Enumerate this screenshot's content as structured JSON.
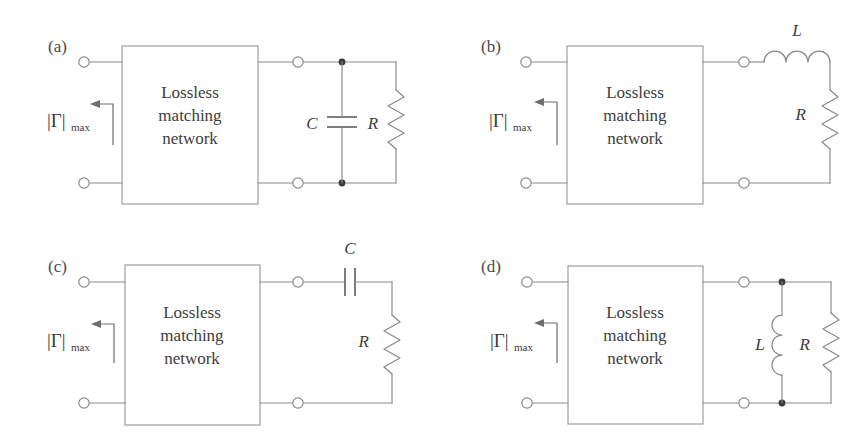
{
  "figure": {
    "background_color": "#ffffff",
    "wire_color": "#8a8a8a",
    "text_color": "#3d3d3d",
    "width": 866,
    "height": 440
  },
  "common": {
    "box_line_1": "Lossless",
    "box_line_2": "matching",
    "box_line_3": "network",
    "gamma_symbol": "|Γ|",
    "gamma_subscript": "max",
    "arrow_direction": "left"
  },
  "panels": [
    {
      "id": "a",
      "label": "(a)",
      "position": "top-left",
      "load_topology": "shunt-C-parallel-R",
      "components": [
        {
          "name": "capacitor",
          "label": "C",
          "orientation": "shunt-horizontal-plates"
        },
        {
          "name": "resistor",
          "label": "R",
          "orientation": "vertical-zigzag"
        }
      ],
      "node_dots": 2
    },
    {
      "id": "b",
      "label": "(b)",
      "position": "top-right",
      "load_topology": "series-L-then-R",
      "components": [
        {
          "name": "inductor",
          "label": "L",
          "orientation": "horizontal-coil"
        },
        {
          "name": "resistor",
          "label": "R",
          "orientation": "vertical-zigzag"
        }
      ],
      "node_dots": 0
    },
    {
      "id": "c",
      "label": "(c)",
      "position": "bottom-left",
      "load_topology": "series-C-then-R",
      "components": [
        {
          "name": "capacitor",
          "label": "C",
          "orientation": "series-vertical-plates"
        },
        {
          "name": "resistor",
          "label": "R",
          "orientation": "vertical-zigzag"
        }
      ],
      "node_dots": 0
    },
    {
      "id": "d",
      "label": "(d)",
      "position": "bottom-right",
      "load_topology": "shunt-L-parallel-R",
      "components": [
        {
          "name": "inductor",
          "label": "L",
          "orientation": "vertical-coil"
        },
        {
          "name": "resistor",
          "label": "R",
          "orientation": "vertical-zigzag"
        }
      ],
      "node_dots": 2
    }
  ]
}
